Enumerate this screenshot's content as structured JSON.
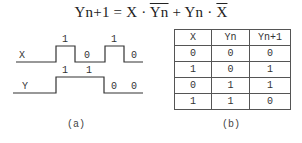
{
  "formula": {
    "lhs": "Yn+1",
    "eq": " = ",
    "t1a": "X",
    "dot1": " · ",
    "t1b": "Yn",
    "plus": " + ",
    "t2a": "Yn",
    "dot2": " · ",
    "t2b": "X"
  },
  "waveform": {
    "caption": "(a)",
    "x_signal": {
      "label": "X",
      "level_labels": [
        "1",
        "0",
        "1",
        "0"
      ]
    },
    "y_signal": {
      "label": "Y",
      "level_labels": [
        "1",
        "1",
        "0",
        "0"
      ]
    }
  },
  "truth_table": {
    "caption": "(b)",
    "headers": [
      "X",
      "Yn",
      "Yn+1"
    ],
    "rows": [
      [
        "0",
        "0",
        "0"
      ],
      [
        "1",
        "0",
        "1"
      ],
      [
        "0",
        "1",
        "1"
      ],
      [
        "1",
        "1",
        "0"
      ]
    ]
  }
}
